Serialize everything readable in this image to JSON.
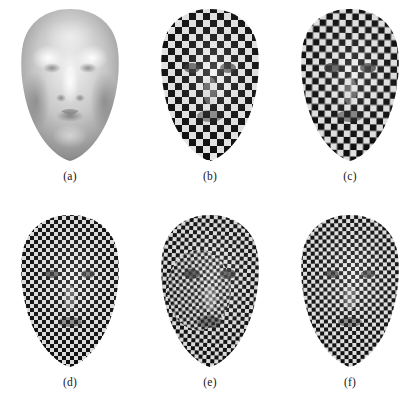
{
  "figure": {
    "kind": "image-grid",
    "rows": 2,
    "columns": 3,
    "background_color": "#ffffff",
    "caption_color": "#161616",
    "panels": [
      {
        "id": "a",
        "caption": "(a)",
        "content": "shaded 3D face mesh rendered with smooth grey Lambertian shading, no texture",
        "texture": "none",
        "shading": "smooth-grey"
      },
      {
        "id": "b",
        "caption": "(b)",
        "content": "3D face mesh with black and white checkerboard texture, coarse squares, frontal view",
        "texture": "checkerboard",
        "checker_scale": "coarse",
        "shading": "textured"
      },
      {
        "id": "c",
        "caption": "(c)",
        "content": "3D face mesh with black and white checkerboard texture, coarse squares, slight variation",
        "texture": "checkerboard",
        "checker_scale": "coarse",
        "shading": "textured"
      },
      {
        "id": "d",
        "caption": "(d)",
        "content": "3D face mesh with fine black and white checkerboard texture",
        "texture": "checkerboard",
        "checker_scale": "fine",
        "shading": "textured"
      },
      {
        "id": "e",
        "caption": "(e)",
        "content": "3D face mesh with fine checkerboard texture, warped / distorted pattern",
        "texture": "checkerboard",
        "checker_scale": "fine",
        "shading": "textured-warped"
      },
      {
        "id": "f",
        "caption": "(f)",
        "content": "3D face mesh with fine checkerboard texture, smoother result",
        "texture": "checkerboard",
        "checker_scale": "fine",
        "shading": "textured"
      }
    ]
  }
}
